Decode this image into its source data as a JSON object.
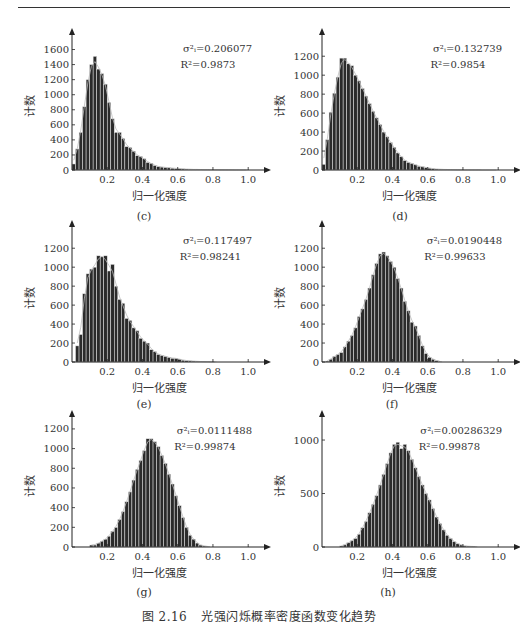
{
  "caption": {
    "figure_number": "图 2.16",
    "title": "光强闪烁概率密度函数变化趋势"
  },
  "chart_data": [
    {
      "id": "c",
      "label": "(c)",
      "type": "bar",
      "title": "",
      "xlabel": "归一化强度",
      "ylabel": "计数",
      "xlim": [
        0,
        1.05
      ],
      "ylim": [
        0,
        1700
      ],
      "xticks": [
        0.2,
        0.4,
        0.6,
        0.8,
        1.0
      ],
      "xtick_labels": [
        "0.2",
        "0.4",
        "0.6",
        "0.8",
        "1.0"
      ],
      "yticks": [
        0,
        200,
        400,
        600,
        800,
        1000,
        1200,
        1400,
        1600
      ],
      "ytick_labels": [
        "0",
        "200",
        "400",
        "600",
        "800",
        "1000",
        "1200",
        "1400",
        "1600"
      ],
      "annotation": {
        "sigma": "σ²ᵢ=0.206077",
        "r2": "R²=0.9873"
      },
      "bin_width": 0.02,
      "x": [
        0.01,
        0.03,
        0.05,
        0.07,
        0.09,
        0.11,
        0.13,
        0.15,
        0.17,
        0.19,
        0.21,
        0.23,
        0.25,
        0.27,
        0.29,
        0.31,
        0.33,
        0.35,
        0.37,
        0.39,
        0.41,
        0.43,
        0.45,
        0.47,
        0.49,
        0.51,
        0.53,
        0.55,
        0.57,
        0.59,
        0.61,
        0.63,
        0.65,
        0.67,
        0.69,
        0.71,
        0.73,
        0.75,
        0.77,
        0.79,
        0.81,
        0.83,
        0.85,
        0.87,
        0.89,
        0.91,
        0.93,
        0.95,
        0.97,
        0.99
      ],
      "values": [
        80,
        280,
        500,
        840,
        1200,
        1400,
        1510,
        1340,
        1280,
        1140,
        900,
        680,
        500,
        500,
        420,
        310,
        300,
        250,
        190,
        180,
        150,
        100,
        90,
        60,
        45,
        40,
        35,
        30,
        25,
        20,
        18,
        15,
        12,
        10,
        8,
        8,
        6,
        5,
        5,
        4,
        4,
        3,
        3,
        2,
        2,
        2,
        1,
        1,
        1,
        1
      ],
      "fit": "lognormal",
      "colors": {
        "bar": "#2b2b2b",
        "bar_edge": "#e6e6e6",
        "fit": "#bbbbbb"
      }
    },
    {
      "id": "d",
      "label": "(d)",
      "type": "bar",
      "xlabel": "归一化强度",
      "ylabel": "计数",
      "xlim": [
        0,
        1.05
      ],
      "ylim": [
        0,
        1350
      ],
      "xticks": [
        0.2,
        0.4,
        0.6,
        0.8,
        1.0
      ],
      "xtick_labels": [
        "0.2",
        "0.4",
        "0.6",
        "0.8",
        "1.0"
      ],
      "yticks": [
        0,
        200,
        400,
        600,
        800,
        1000,
        1200
      ],
      "ytick_labels": [
        "0",
        "200",
        "400",
        "600",
        "800",
        "1000",
        "1200"
      ],
      "annotation": {
        "sigma": "σ²ᵢ=0.132739",
        "r2": "R²=0.9854"
      },
      "bin_width": 0.02,
      "x": [
        0.01,
        0.03,
        0.05,
        0.07,
        0.09,
        0.11,
        0.13,
        0.15,
        0.17,
        0.19,
        0.21,
        0.23,
        0.25,
        0.27,
        0.29,
        0.31,
        0.33,
        0.35,
        0.37,
        0.39,
        0.41,
        0.43,
        0.45,
        0.47,
        0.49,
        0.51,
        0.53,
        0.55,
        0.57,
        0.59,
        0.61,
        0.63,
        0.65,
        0.67,
        0.69,
        0.71,
        0.73,
        0.75,
        0.77,
        0.79,
        0.81,
        0.83,
        0.85,
        0.87,
        0.89,
        0.91,
        0.93,
        0.95,
        0.97,
        0.99
      ],
      "values": [
        60,
        320,
        610,
        810,
        980,
        1180,
        1180,
        1120,
        1100,
        1000,
        940,
        860,
        780,
        700,
        620,
        550,
        480,
        400,
        350,
        290,
        240,
        180,
        140,
        100,
        80,
        70,
        55,
        40,
        35,
        25,
        20,
        15,
        10,
        8,
        6,
        5,
        4,
        3,
        2,
        2,
        1,
        1,
        1,
        1,
        1,
        0,
        0,
        0,
        0,
        0
      ],
      "fit": "lognormal",
      "colors": {
        "bar": "#2b2b2b",
        "bar_edge": "#e6e6e6",
        "fit": "#bbbbbb"
      }
    },
    {
      "id": "e",
      "label": "(e)",
      "type": "bar",
      "xlabel": "归一化强度",
      "ylabel": "计数",
      "xlim": [
        0,
        1.05
      ],
      "ylim": [
        0,
        1350
      ],
      "xticks": [
        0.2,
        0.4,
        0.6,
        0.8,
        1.0
      ],
      "xtick_labels": [
        "0.2",
        "0.4",
        "0.6",
        "0.8",
        "1.0"
      ],
      "yticks": [
        0,
        200,
        400,
        600,
        800,
        1000,
        1200
      ],
      "ytick_labels": [
        "0",
        "200",
        "400",
        "600",
        "800",
        "1000",
        "1200"
      ],
      "annotation": {
        "sigma": "σ²ᵢ=0.117497",
        "r2": "R²=0.98241"
      },
      "bin_width": 0.02,
      "x": [
        0.03,
        0.05,
        0.07,
        0.09,
        0.11,
        0.13,
        0.15,
        0.17,
        0.19,
        0.21,
        0.23,
        0.25,
        0.27,
        0.29,
        0.31,
        0.33,
        0.35,
        0.37,
        0.39,
        0.41,
        0.43,
        0.45,
        0.47,
        0.49,
        0.51,
        0.53,
        0.55,
        0.57,
        0.59,
        0.61,
        0.63,
        0.65,
        0.67,
        0.69,
        0.71,
        0.73,
        0.75,
        0.77,
        0.79,
        0.81
      ],
      "values": [
        170,
        290,
        720,
        930,
        980,
        1000,
        1120,
        1110,
        1120,
        960,
        1030,
        800,
        660,
        620,
        460,
        440,
        360,
        330,
        250,
        220,
        200,
        130,
        110,
        80,
        70,
        60,
        50,
        40,
        40,
        30,
        20,
        15,
        12,
        10,
        8,
        5,
        5,
        3,
        2,
        1
      ],
      "fit": "lognormal",
      "colors": {
        "bar": "#2b2b2b",
        "bar_edge": "#e6e6e6",
        "fit": "#bbbbbb"
      }
    },
    {
      "id": "f",
      "label": "(f)",
      "type": "bar",
      "xlabel": "归一化强度",
      "ylabel": "计数",
      "xlim": [
        0,
        1.05
      ],
      "ylim": [
        0,
        1350
      ],
      "xticks": [
        0.2,
        0.4,
        0.6,
        0.8,
        1.0
      ],
      "xtick_labels": [
        "0.2",
        "0.4",
        "0.6",
        "0.8",
        "1.0"
      ],
      "yticks": [
        0,
        200,
        400,
        600,
        800,
        1000,
        1200
      ],
      "ytick_labels": [
        "0",
        "200",
        "400",
        "600",
        "800",
        "1000",
        "1200"
      ],
      "annotation": {
        "sigma": "σ²ᵢ=0.0190448",
        "r2": "R²=0.99633"
      },
      "bin_width": 0.02,
      "x": [
        0.03,
        0.05,
        0.07,
        0.09,
        0.11,
        0.13,
        0.15,
        0.17,
        0.19,
        0.21,
        0.23,
        0.25,
        0.27,
        0.29,
        0.31,
        0.33,
        0.35,
        0.37,
        0.39,
        0.41,
        0.43,
        0.45,
        0.47,
        0.49,
        0.51,
        0.53,
        0.55,
        0.57,
        0.59,
        0.61,
        0.63,
        0.65,
        0.67
      ],
      "values": [
        10,
        30,
        60,
        80,
        100,
        160,
        220,
        280,
        360,
        480,
        560,
        660,
        780,
        920,
        1040,
        1140,
        1160,
        1120,
        1060,
        1000,
        880,
        780,
        640,
        540,
        420,
        380,
        280,
        170,
        90,
        50,
        30,
        15,
        5
      ],
      "fit": "lognormal",
      "colors": {
        "bar": "#2b2b2b",
        "bar_edge": "#e6e6e6",
        "fit": "#bbbbbb"
      }
    },
    {
      "id": "g",
      "label": "(g)",
      "type": "bar",
      "xlabel": "归一化强度",
      "ylabel": "计数",
      "xlim": [
        0,
        1.05
      ],
      "ylim": [
        0,
        1250
      ],
      "xticks": [
        0.2,
        0.4,
        0.6,
        0.8,
        1.0
      ],
      "xtick_labels": [
        "0.2",
        "0.4",
        "0.6",
        "0.8",
        "1.0"
      ],
      "yticks": [
        0,
        200,
        400,
        600,
        800,
        1000,
        1200
      ],
      "ytick_labels": [
        "0",
        "200",
        "400",
        "600",
        "800",
        "1000",
        "1200"
      ],
      "annotation": {
        "sigma": "σ²ᵢ=0.0111488",
        "r2": "R²=0.99874"
      },
      "bin_width": 0.02,
      "x": [
        0.11,
        0.13,
        0.15,
        0.17,
        0.19,
        0.21,
        0.23,
        0.25,
        0.27,
        0.29,
        0.31,
        0.33,
        0.35,
        0.37,
        0.39,
        0.41,
        0.43,
        0.45,
        0.47,
        0.49,
        0.51,
        0.53,
        0.55,
        0.57,
        0.59,
        0.61,
        0.63,
        0.65,
        0.67,
        0.69,
        0.71,
        0.73,
        0.75,
        0.77
      ],
      "values": [
        20,
        20,
        40,
        60,
        80,
        110,
        160,
        200,
        280,
        360,
        460,
        560,
        680,
        790,
        880,
        980,
        1100,
        1100,
        1070,
        1020,
        930,
        850,
        740,
        640,
        520,
        420,
        300,
        200,
        120,
        80,
        40,
        20,
        10,
        5
      ],
      "fit": "lognormal",
      "colors": {
        "bar": "#2b2b2b",
        "bar_edge": "#e6e6e6",
        "fit": "#bbbbbb"
      }
    },
    {
      "id": "h",
      "label": "(h)",
      "type": "bar",
      "xlabel": "归一化强度",
      "ylabel": "计数",
      "xlim": [
        0,
        1.05
      ],
      "ylim": [
        0,
        1150
      ],
      "xticks": [
        0.2,
        0.4,
        0.6,
        0.8,
        1.0
      ],
      "xtick_labels": [
        "0.2",
        "0.4",
        "0.6",
        "0.8",
        "1.0"
      ],
      "yticks": [
        0,
        500,
        1000
      ],
      "ytick_labels": [
        "0",
        "500",
        "1000"
      ],
      "annotation": {
        "sigma": "σ²ᵢ=0.00286329",
        "r2": "R²=0.99878"
      },
      "bin_width": 0.02,
      "x": [
        0.11,
        0.13,
        0.15,
        0.17,
        0.19,
        0.21,
        0.23,
        0.25,
        0.27,
        0.29,
        0.31,
        0.33,
        0.35,
        0.37,
        0.39,
        0.41,
        0.43,
        0.45,
        0.47,
        0.49,
        0.51,
        0.53,
        0.55,
        0.57,
        0.59,
        0.61,
        0.63,
        0.65,
        0.67,
        0.69,
        0.71,
        0.73,
        0.75,
        0.77,
        0.79,
        0.81,
        0.83,
        0.85,
        0.87
      ],
      "values": [
        10,
        20,
        40,
        60,
        80,
        120,
        180,
        240,
        320,
        400,
        480,
        580,
        680,
        780,
        880,
        960,
        980,
        920,
        960,
        900,
        820,
        740,
        660,
        580,
        500,
        440,
        360,
        280,
        220,
        160,
        110,
        80,
        50,
        30,
        20,
        10,
        8,
        5,
        3
      ],
      "fit": "lognormal",
      "colors": {
        "bar": "#2b2b2b",
        "bar_edge": "#e6e6e6",
        "fit": "#bbbbbb"
      }
    }
  ]
}
